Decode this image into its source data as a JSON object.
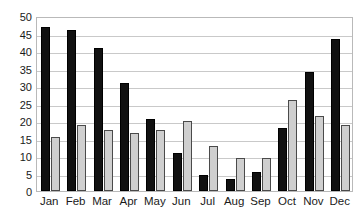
{
  "chart_data": {
    "type": "bar",
    "title": "",
    "subtitle": "",
    "xlabel": "",
    "ylabel": "",
    "categories": [
      "Jan",
      "Feb",
      "Mar",
      "Apr",
      "May",
      "Jun",
      "Jul",
      "Aug",
      "Sep",
      "Oct",
      "Nov",
      "Dec"
    ],
    "series": [
      {
        "name": "Series 1",
        "color": "#111111",
        "values": [
          47,
          46,
          41,
          31,
          20.5,
          11,
          4.5,
          3.5,
          5.5,
          18,
          34,
          43.5
        ]
      },
      {
        "name": "Series 2",
        "color": "#cfcfcf",
        "values": [
          15.5,
          19,
          17.5,
          16.5,
          17.5,
          20,
          13,
          9.5,
          9.5,
          26,
          21.5,
          19
        ]
      }
    ],
    "ylim": [
      0,
      50
    ],
    "ytick_step": 5,
    "yticks": [
      0,
      5,
      10,
      15,
      20,
      25,
      30,
      35,
      40,
      45,
      50
    ],
    "ytick_labels": [
      "0",
      "5",
      "10",
      "15",
      "20",
      "25",
      "30",
      "35",
      "40",
      "45",
      "50"
    ],
    "grid": true,
    "grid_axis": "y",
    "legend": false,
    "legend_position": "none",
    "plot_border_color": "#b9b9b9",
    "gridline_color": "#c9c9c9",
    "background_color": "#ffffff",
    "text_color": "#1a1a1a"
  }
}
